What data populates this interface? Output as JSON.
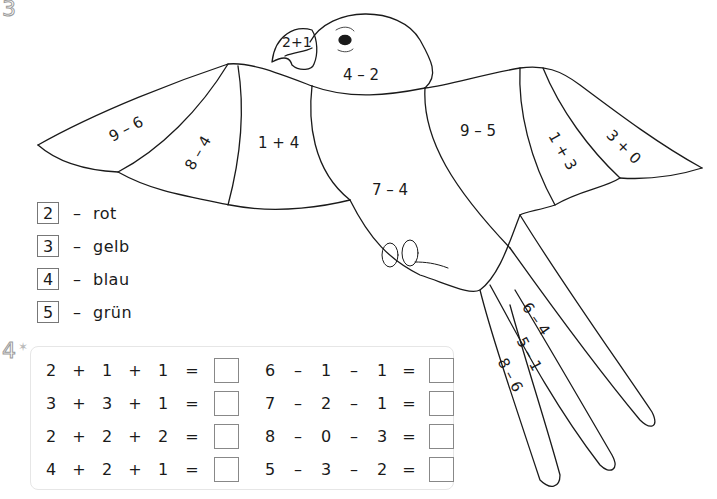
{
  "tasks": {
    "task3_number": "3",
    "task4_number": "4"
  },
  "bird": {
    "regions": [
      {
        "id": "beak",
        "expr": "2+1"
      },
      {
        "id": "head",
        "expr": "4 – 2"
      },
      {
        "id": "left-wing-tip",
        "expr": "9 – 6"
      },
      {
        "id": "left-wing-mid",
        "expr": "8 – 4"
      },
      {
        "id": "left-wing-inner",
        "expr": "1 + 4"
      },
      {
        "id": "body",
        "expr": "7 – 4"
      },
      {
        "id": "right-wing-inner",
        "expr": "9 – 5"
      },
      {
        "id": "right-wing-mid",
        "expr": "1 + 3"
      },
      {
        "id": "right-wing-tip",
        "expr": "3 + 0"
      },
      {
        "id": "tail-right",
        "expr": "6 – 4"
      },
      {
        "id": "tail-middle",
        "expr": "5 – 1"
      },
      {
        "id": "tail-left",
        "expr": "8 – 6"
      }
    ]
  },
  "legend": [
    {
      "number": "2",
      "dash": "–",
      "color_name": "rot"
    },
    {
      "number": "3",
      "dash": "–",
      "color_name": "gelb"
    },
    {
      "number": "4",
      "dash": "–",
      "color_name": "blau"
    },
    {
      "number": "5",
      "dash": "–",
      "color_name": "grün"
    }
  ],
  "equations": {
    "left": [
      {
        "a": "2",
        "op1": "+",
        "b": "1",
        "op2": "+",
        "c": "1",
        "eq": "=",
        "answer": ""
      },
      {
        "a": "3",
        "op1": "+",
        "b": "3",
        "op2": "+",
        "c": "1",
        "eq": "=",
        "answer": ""
      },
      {
        "a": "2",
        "op1": "+",
        "b": "2",
        "op2": "+",
        "c": "2",
        "eq": "=",
        "answer": ""
      },
      {
        "a": "4",
        "op1": "+",
        "b": "2",
        "op2": "+",
        "c": "1",
        "eq": "=",
        "answer": ""
      }
    ],
    "right": [
      {
        "a": "6",
        "op1": "–",
        "b": "1",
        "op2": "–",
        "c": "1",
        "eq": "=",
        "answer": ""
      },
      {
        "a": "7",
        "op1": "–",
        "b": "2",
        "op2": "–",
        "c": "1",
        "eq": "=",
        "answer": ""
      },
      {
        "a": "8",
        "op1": "–",
        "b": "0",
        "op2": "–",
        "c": "3",
        "eq": "=",
        "answer": ""
      },
      {
        "a": "5",
        "op1": "–",
        "b": "3",
        "op2": "–",
        "c": "2",
        "eq": "=",
        "answer": ""
      }
    ]
  },
  "colors": {
    "line": "#1a1a1a",
    "box_border": "#777777",
    "panel_border": "#e6e6e6",
    "task_number_outline": "#9a9a9a"
  }
}
